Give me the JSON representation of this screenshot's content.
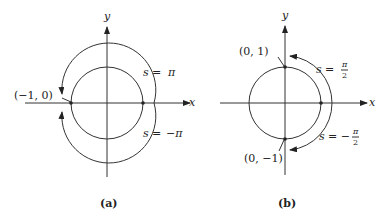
{
  "panels": [
    {
      "id": "a",
      "caption": "(a)",
      "axes": {
        "x_label": "x",
        "y_label": "y"
      },
      "point_label": "(−1, 0)",
      "arc_upper_label_lhs": "s",
      "arc_upper_label_eq": "=",
      "arc_upper_label_rhs": "π",
      "arc_lower_label_lhs": "s",
      "arc_lower_label_eq": "=",
      "arc_lower_label_rhs": "−π"
    },
    {
      "id": "b",
      "caption": "(b)",
      "axes": {
        "x_label": "x",
        "y_label": "y"
      },
      "point_top_label": "(0, 1)",
      "point_bottom_label": "(0, −1)",
      "arc_upper_label_lhs": "s",
      "arc_upper_label_eq": "=",
      "arc_upper_label_num": "π",
      "arc_upper_label_den": "2",
      "arc_lower_label_lhs": "s",
      "arc_lower_label_eq": "= −",
      "arc_lower_label_num": "π",
      "arc_lower_label_den": "2"
    }
  ]
}
